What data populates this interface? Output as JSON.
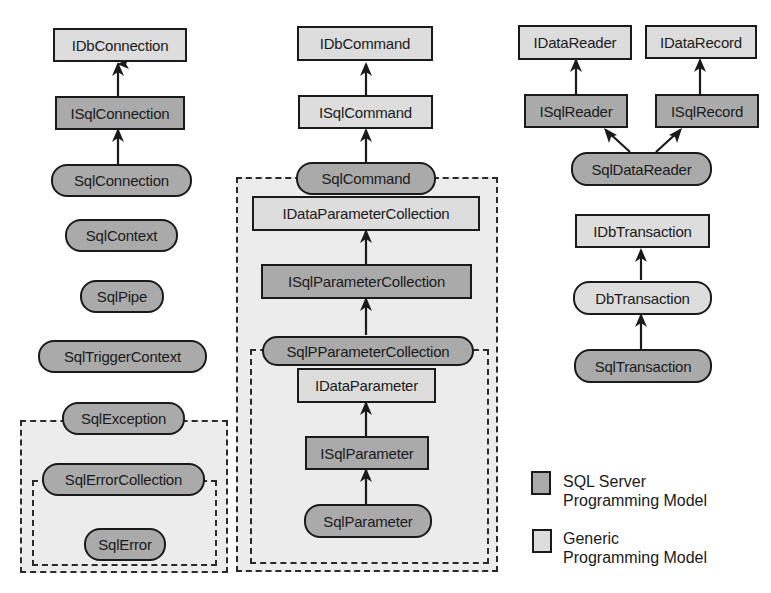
{
  "diagram": {
    "colors": {
      "sql_server": "#aaaaaa",
      "generic": "#dddddd",
      "group_bg": "#ececec",
      "stroke": "#1a1a1a"
    },
    "columns": {
      "connection": {
        "nodes": [
          {
            "id": "IDbConnection",
            "label": "IDbConnection",
            "shape": "rect",
            "model": "generic"
          },
          {
            "id": "ISqlConnection",
            "label": "ISqlConnection",
            "shape": "rect",
            "model": "sql"
          },
          {
            "id": "SqlConnection",
            "label": "SqlConnection",
            "shape": "pill",
            "model": "sql"
          },
          {
            "id": "SqlContext",
            "label": "SqlContext",
            "shape": "pill",
            "model": "sql"
          },
          {
            "id": "SqlPipe",
            "label": "SqlPipe",
            "shape": "pill",
            "model": "sql"
          },
          {
            "id": "SqlTriggerContext",
            "label": "SqlTriggerContext",
            "shape": "pill",
            "model": "sql"
          },
          {
            "id": "SqlException",
            "label": "SqlException",
            "shape": "pill",
            "model": "sql"
          },
          {
            "id": "SqlErrorCollection",
            "label": "SqlErrorCollection",
            "shape": "pill",
            "model": "sql"
          },
          {
            "id": "SqlError",
            "label": "SqlError",
            "shape": "pill",
            "model": "sql"
          }
        ]
      },
      "command": {
        "nodes": [
          {
            "id": "IDbCommand",
            "label": "IDbCommand",
            "shape": "rect",
            "model": "generic"
          },
          {
            "id": "ISqlCommand",
            "label": "ISqlCommand",
            "shape": "rect",
            "model": "generic"
          },
          {
            "id": "SqlCommand",
            "label": "SqlCommand",
            "shape": "pill",
            "model": "sql"
          },
          {
            "id": "IDataParameterCollection",
            "label": "IDataParameterCollection",
            "shape": "rect",
            "model": "generic"
          },
          {
            "id": "ISqlParameterCollection",
            "label": "ISqlParameterCollection",
            "shape": "rect",
            "model": "sql"
          },
          {
            "id": "SqlPParameterCollection",
            "label": "SqlPParameterCollection",
            "shape": "pill",
            "model": "sql"
          },
          {
            "id": "IDataParameter",
            "label": "IDataParameter",
            "shape": "rect",
            "model": "generic"
          },
          {
            "id": "ISqlParameter",
            "label": "ISqlParameter",
            "shape": "rect",
            "model": "sql"
          },
          {
            "id": "SqlParameter",
            "label": "SqlParameter",
            "shape": "pill",
            "model": "sql"
          }
        ]
      },
      "reader": {
        "nodes": [
          {
            "id": "IDataReader",
            "label": "IDataReader",
            "shape": "rect",
            "model": "generic"
          },
          {
            "id": "IDataRecord",
            "label": "IDataRecord",
            "shape": "rect",
            "model": "generic"
          },
          {
            "id": "ISqlReader",
            "label": "ISqlReader",
            "shape": "rect",
            "model": "sql"
          },
          {
            "id": "ISqlRecord",
            "label": "ISqlRecord",
            "shape": "rect",
            "model": "sql"
          },
          {
            "id": "SqlDataReader",
            "label": "SqlDataReader",
            "shape": "pill",
            "model": "sql"
          },
          {
            "id": "IDbTransaction",
            "label": "IDbTransaction",
            "shape": "rect",
            "model": "generic"
          },
          {
            "id": "DbTransaction",
            "label": "DbTransaction",
            "shape": "pill",
            "model": "generic"
          },
          {
            "id": "SqlTransaction",
            "label": "SqlTransaction",
            "shape": "pill",
            "model": "sql"
          }
        ]
      }
    },
    "edges": [
      {
        "from": "ISqlConnection",
        "to": "IDbConnection"
      },
      {
        "from": "SqlConnection",
        "to": "ISqlConnection"
      },
      {
        "from": "ISqlCommand",
        "to": "IDbCommand"
      },
      {
        "from": "SqlCommand",
        "to": "ISqlCommand"
      },
      {
        "from": "ISqlParameterCollection",
        "to": "IDataParameterCollection"
      },
      {
        "from": "SqlPParameterCollection",
        "to": "ISqlParameterCollection"
      },
      {
        "from": "ISqlParameter",
        "to": "IDataParameter"
      },
      {
        "from": "SqlParameter",
        "to": "ISqlParameter"
      },
      {
        "from": "ISqlReader",
        "to": "IDataReader"
      },
      {
        "from": "ISqlRecord",
        "to": "IDataRecord"
      },
      {
        "from": "SqlDataReader",
        "to": "ISqlReader"
      },
      {
        "from": "SqlDataReader",
        "to": "ISqlRecord"
      },
      {
        "from": "DbTransaction",
        "to": "IDbTransaction"
      },
      {
        "from": "SqlTransaction",
        "to": "DbTransaction"
      }
    ],
    "groups": [
      {
        "owner": "SqlException",
        "contains": [
          "SqlErrorCollection",
          "SqlError"
        ]
      },
      {
        "owner": "SqlErrorCollection",
        "contains": [
          "SqlError"
        ]
      },
      {
        "owner": "SqlCommand",
        "contains": [
          "IDataParameterCollection",
          "ISqlParameterCollection",
          "SqlPParameterCollection",
          "IDataParameter",
          "ISqlParameter",
          "SqlParameter"
        ]
      },
      {
        "owner": "SqlPParameterCollection",
        "contains": [
          "IDataParameter",
          "ISqlParameter",
          "SqlParameter"
        ]
      }
    ]
  },
  "legend": {
    "items": [
      {
        "label": "SQL Server\nProgramming Model",
        "color": "#aaaaaa"
      },
      {
        "label": "Generic\nProgramming Model",
        "color": "#dddddd"
      }
    ]
  }
}
